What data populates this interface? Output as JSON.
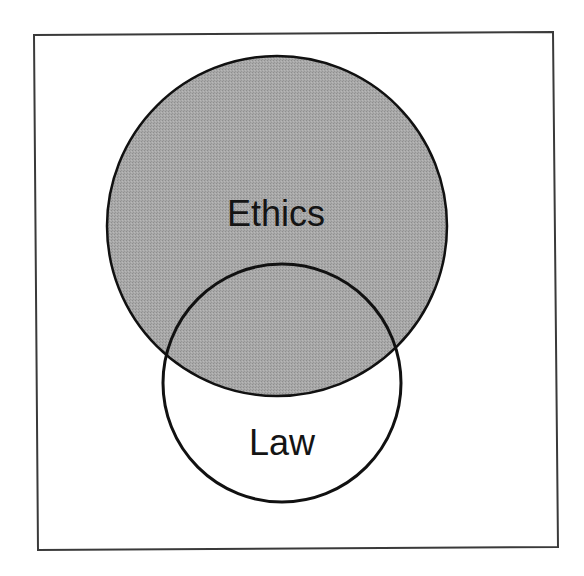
{
  "diagram": {
    "type": "venn",
    "frame": {
      "stroke": "#3a3a3a",
      "points": [
        [
          34,
          35
        ],
        [
          553,
          32
        ],
        [
          558,
          547
        ],
        [
          38,
          550
        ]
      ]
    },
    "sets": [
      {
        "id": "ethics",
        "label": "Ethics",
        "cx": 277,
        "cy": 226,
        "r": 170,
        "fill": "#a4a4a4",
        "stroke": "#111111",
        "label_x": 276,
        "label_y": 226,
        "font_size": 36
      },
      {
        "id": "law",
        "label": "Law",
        "cx": 282,
        "cy": 383,
        "r": 119,
        "fill": "none",
        "stroke": "#111111",
        "label_x": 282,
        "label_y": 455,
        "font_size": 36
      }
    ],
    "relationship": "Law partially overlaps Ethics; the overlap lies inside the shaded Ethics region"
  }
}
